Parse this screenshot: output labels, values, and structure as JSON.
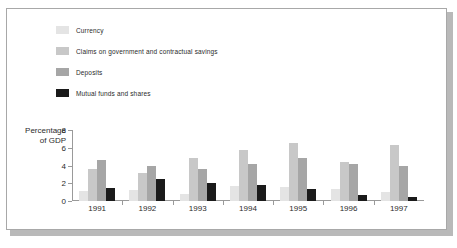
{
  "chart_data": {
    "type": "bar",
    "title": "",
    "subtitle": "",
    "xlabel": "",
    "ylabel": "Percentage of GDP",
    "ylabel_line1": "Percentage",
    "ylabel_line2": "of GDP",
    "categories": [
      "1991",
      "1992",
      "1993",
      "1994",
      "1995",
      "1996",
      "1997"
    ],
    "ylim": [
      0,
      8
    ],
    "yticks": [
      "0",
      "2",
      "4",
      "6",
      "8"
    ],
    "grid": false,
    "legend_position": "top-left",
    "series": [
      {
        "name": "Currency",
        "color": "#e4e4e4",
        "values": [
          1.1,
          1.2,
          0.8,
          1.7,
          1.55,
          1.4,
          1.0
        ]
      },
      {
        "name": "Claims on government and contractual savings",
        "color": "#c8c8c8",
        "values": [
          3.6,
          3.2,
          4.85,
          5.8,
          6.5,
          4.4,
          6.3
        ]
      },
      {
        "name": "Deposits",
        "color": "#a6a6a6",
        "values": [
          4.6,
          3.9,
          3.6,
          4.2,
          4.8,
          4.15,
          4.0
        ]
      },
      {
        "name": "Mutual funds and shares",
        "color": "#1a1a1a",
        "values": [
          1.5,
          2.5,
          2.0,
          1.8,
          1.4,
          0.7,
          0.4
        ]
      }
    ]
  },
  "figure": {
    "border_color": "#a8a8a8",
    "shadow_color": "#b9b9b9",
    "background": "#ffffff",
    "axis_color": "#9a9a9a",
    "text_color": "#2b2b2b"
  }
}
